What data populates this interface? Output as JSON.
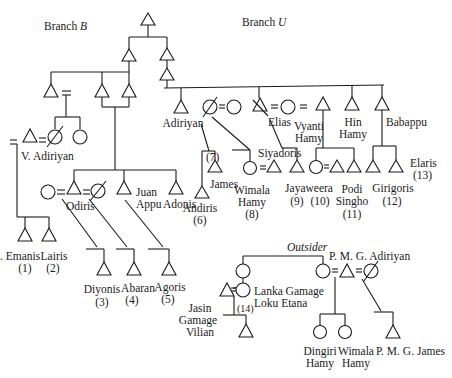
{
  "diagram": {
    "type": "kinship-genealogy",
    "branch_labels": {
      "branch_b": "Branch B",
      "branch_b_prefix": "Branch ",
      "branch_b_letter": "B",
      "branch_u_prefix": "Branch ",
      "branch_u_letter": "U"
    },
    "outsider_label": "Outsider",
    "people": {
      "v_adiriyan": "V. Adiriyan",
      "adiriyan": "Adiriyan",
      "elias": "Elias",
      "vyanti_hamy_1": "Vyanti",
      "vyanti_hamy_2": "Hamy",
      "hin_hamy_1": "Hin",
      "hin_hamy_2": "Hamy",
      "babappu": "Babappu",
      "siyadoris": "Siyadoris",
      "odiris": "Odiris",
      "juan_appu_1": "Juan",
      "juan_appu_2": "Appu",
      "adonis": "Adonis",
      "andiris": "Andiris",
      "james": "James",
      "wimala_hamy_1": "Wimala",
      "wimala_hamy_2": "Hamy",
      "jayaweera": "Jayaweera",
      "podi_singho_1": "Podi",
      "podi_singho_2": "Singho",
      "girigoris": "Girigoris",
      "elaris": "Elaris",
      "emanis": ". Emanis",
      "lairis": "Lairis",
      "diyonis": "Diyonis",
      "abaran": "Abaran",
      "agoris": "Agoris",
      "jasin_1": "Jasin",
      "jasin_2": "Gamage",
      "jasin_3": "Vilian",
      "lanka_1": "Lanka Gamage",
      "lanka_2": "Loku Etana",
      "pmg_adiriyan": "P. M. G. Adiriyan",
      "dingiri_1": "Dingiri",
      "dingiri_2": "Hamy",
      "wimala2_1": "Wimala",
      "wimala2_2": "Hamy",
      "pmg_james": "P. M. G. James"
    },
    "numbers": {
      "n1": "(1)",
      "n2": "(2)",
      "n3": "(3)",
      "n4": "(4)",
      "n5": "(5)",
      "n6": "(6)",
      "n7": "(7)",
      "n8": "(8)",
      "n9": "(9)",
      "n10": "(10)",
      "n11": "(11)",
      "n12": "(12)",
      "n13": "(13)",
      "n14": "(14)"
    },
    "marriage_symbol": "=",
    "legend_symbols": {
      "triangle": "male",
      "circle": "female",
      "slashed": "deceased"
    }
  }
}
